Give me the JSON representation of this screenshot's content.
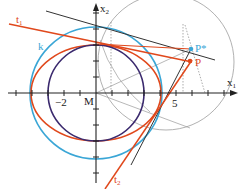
{
  "diagram": {
    "type": "geometry-ellipse-construction",
    "axes": {
      "x_label": "x",
      "x_sub": "1",
      "y_label": "x",
      "y_sub": "2",
      "origin_label": "M"
    },
    "tick_labels": {
      "neg2": "−2",
      "five": "5"
    },
    "curves": {
      "circle_k": {
        "label": "k",
        "color": "#3aa6d6"
      },
      "ellipse": {
        "color": "#e0481c"
      },
      "inner_circle": {
        "color": "#3b2a6e"
      },
      "construction_circle": {
        "color": "#9a9a9a"
      }
    },
    "points": {
      "P_star": {
        "label": "P*",
        "color": "#3aa6d6"
      },
      "P": {
        "label": "P",
        "color": "#e0481c"
      }
    },
    "tangents": {
      "t1": {
        "label": "t",
        "sub": "1",
        "color": "#e0481c"
      },
      "t2": {
        "label": "t",
        "sub": "2",
        "color": "#e0481c"
      }
    }
  }
}
